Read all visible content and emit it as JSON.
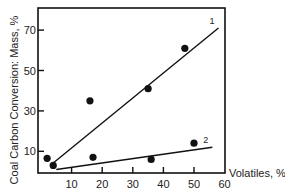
{
  "chart_data": {
    "type": "scatter",
    "title": "",
    "xlabel": "Volatiles, %",
    "ylabel": "Coal Carbon Conversion: Mass, %",
    "xlim": [
      0,
      60
    ],
    "ylim": [
      0,
      80
    ],
    "xticks": [
      10,
      20,
      30,
      40,
      50,
      60
    ],
    "yticks": [
      10,
      30,
      50,
      70
    ],
    "grid": false,
    "legend": "none (lines labeled inline '1' and '2')",
    "series": [
      {
        "name": "1",
        "points": [
          {
            "x": 2,
            "y": 6.5
          },
          {
            "x": 16,
            "y": 35
          },
          {
            "x": 35,
            "y": 41
          },
          {
            "x": 47,
            "y": 61
          }
        ],
        "fit_line": [
          {
            "x": 3,
            "y": 3
          },
          {
            "x": 58,
            "y": 71
          }
        ]
      },
      {
        "name": "2",
        "points": [
          {
            "x": 4,
            "y": 3
          },
          {
            "x": 17,
            "y": 7
          },
          {
            "x": 36,
            "y": 6
          },
          {
            "x": 50,
            "y": 14
          }
        ],
        "fit_line": [
          {
            "x": 5,
            "y": 1
          },
          {
            "x": 56,
            "y": 12
          }
        ]
      }
    ]
  },
  "colors": {
    "ink": "#111111",
    "background": "#ffffff"
  }
}
